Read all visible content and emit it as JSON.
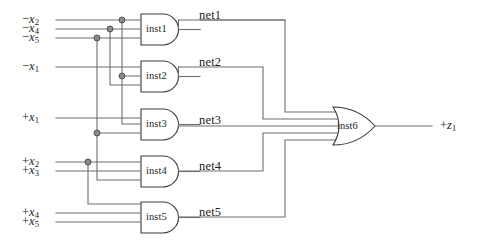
{
  "diagram": {
    "type": "logic-circuit-schematic",
    "wire_color": "#6e6e6e",
    "gate_outline_color": "#3a3a3a",
    "background": "#ffffff"
  },
  "inputs": [
    {
      "id": "in-nx2",
      "sign": "−",
      "var": "x",
      "index": "2",
      "label": "−x2",
      "y": 20
    },
    {
      "id": "in-nx4",
      "sign": "−",
      "var": "x",
      "index": "4",
      "label": "−x4",
      "y": 29
    },
    {
      "id": "in-nx5",
      "sign": "−",
      "var": "x",
      "index": "5",
      "label": "−x5",
      "y": 38
    },
    {
      "id": "in-nx1",
      "sign": "−",
      "var": "x",
      "index": "1",
      "label": "−x1",
      "y": 67
    },
    {
      "id": "in-px1",
      "sign": "+",
      "var": "x",
      "index": "1",
      "label": "+x1",
      "y": 118
    },
    {
      "id": "in-px2",
      "sign": "+",
      "var": "x",
      "index": "2",
      "label": "+x2",
      "y": 162
    },
    {
      "id": "in-px3",
      "sign": "+",
      "var": "x",
      "index": "3",
      "label": "+x3",
      "y": 171
    },
    {
      "id": "in-px4",
      "sign": "+",
      "var": "x",
      "index": "4",
      "label": "+x4",
      "y": 213
    },
    {
      "id": "in-px5",
      "sign": "+",
      "var": "x",
      "index": "5",
      "label": "+x5",
      "y": 222
    }
  ],
  "gates": [
    {
      "id": "inst1",
      "label": "inst1",
      "kind": "and",
      "output_net": "net1",
      "inputs": [
        "−x2",
        "−x4",
        "−x5"
      ]
    },
    {
      "id": "inst2",
      "label": "inst2",
      "kind": "and",
      "output_net": "net2",
      "inputs": [
        "−x1",
        "−x2",
        "−x4"
      ]
    },
    {
      "id": "inst3",
      "label": "inst3",
      "kind": "and",
      "output_net": "net3",
      "inputs": [
        "+x1",
        "−x4",
        "−x5"
      ]
    },
    {
      "id": "inst4",
      "label": "inst4",
      "kind": "and",
      "output_net": "net4",
      "inputs": [
        "+x2",
        "+x3",
        "−x5"
      ]
    },
    {
      "id": "inst5",
      "label": "inst5",
      "kind": "and",
      "output_net": "net5",
      "inputs": [
        "+x4",
        "+x5",
        "+x2"
      ]
    },
    {
      "id": "inst6",
      "label": "inst6",
      "kind": "or",
      "output_net": "+z1",
      "inputs": [
        "net1",
        "net2",
        "net3",
        "net4",
        "net5"
      ]
    }
  ],
  "nets": [
    {
      "id": "net1",
      "label": "net1"
    },
    {
      "id": "net2",
      "label": "net2"
    },
    {
      "id": "net3",
      "label": "net3"
    },
    {
      "id": "net4",
      "label": "net4"
    },
    {
      "id": "net5",
      "label": "net5"
    }
  ],
  "output": {
    "id": "out-z1",
    "sign": "+",
    "var": "z",
    "index": "1",
    "label": "+z1"
  }
}
